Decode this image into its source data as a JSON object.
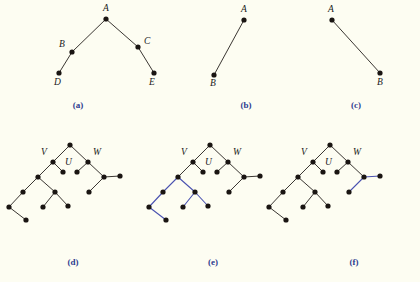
{
  "figure": {
    "background_color": "#fdfdf2",
    "edge_color": "#241f1c",
    "highlight_color": "#4a52b0",
    "node_color": "#1a1512",
    "caption_color": "#2d3b8f",
    "node_radius": 2.6,
    "edge_width": 0.9,
    "highlight_width": 1.1
  },
  "panels": [
    {
      "id": "a",
      "caption": "(a)",
      "caption_x": 63,
      "caption_y": 100,
      "nodes": [
        {
          "name": "A",
          "x": 106,
          "y": 19
        },
        {
          "name": "B",
          "x": 72,
          "y": 52
        },
        {
          "name": "C",
          "x": 138,
          "y": 47
        },
        {
          "name": "D",
          "x": 59,
          "y": 73
        },
        {
          "name": "E",
          "x": 154,
          "y": 73
        }
      ],
      "labels": [
        {
          "text": "A",
          "x": 103,
          "y": 4
        },
        {
          "text": "B",
          "x": 59,
          "y": 40
        },
        {
          "text": "C",
          "x": 144,
          "y": 37
        },
        {
          "text": "D",
          "x": 54,
          "y": 78
        },
        {
          "text": "E",
          "x": 149,
          "y": 78
        }
      ],
      "edges": [
        {
          "from": "A",
          "to": "B",
          "highlight": false
        },
        {
          "from": "B",
          "to": "D",
          "highlight": false
        },
        {
          "from": "A",
          "to": "C",
          "highlight": false
        },
        {
          "from": "C",
          "to": "E",
          "highlight": false
        }
      ]
    },
    {
      "id": "b",
      "caption": "(b)",
      "caption_x": 231,
      "caption_y": 100,
      "nodes": [
        {
          "name": "A",
          "x": 244,
          "y": 20
        },
        {
          "name": "B",
          "x": 214,
          "y": 75
        }
      ],
      "labels": [
        {
          "text": "A",
          "x": 241,
          "y": 5
        },
        {
          "text": "B",
          "x": 210,
          "y": 79
        }
      ],
      "edges": [
        {
          "from": "A",
          "to": "B",
          "highlight": false
        }
      ]
    },
    {
      "id": "c",
      "caption": "(c)",
      "caption_x": 341,
      "caption_y": 100,
      "nodes": [
        {
          "name": "A",
          "x": 332,
          "y": 20
        },
        {
          "name": "B",
          "x": 380,
          "y": 73
        }
      ],
      "labels": [
        {
          "text": "A",
          "x": 328,
          "y": 5
        },
        {
          "text": "B",
          "x": 377,
          "y": 78
        }
      ],
      "edges": [
        {
          "from": "A",
          "to": "B",
          "highlight": false
        }
      ]
    },
    {
      "id": "d",
      "caption": "(d)",
      "caption_x": 58,
      "caption_y": 257,
      "nodes": [
        {
          "name": "r",
          "x": 70,
          "y": 145
        },
        {
          "name": "V",
          "x": 53,
          "y": 162
        },
        {
          "name": "u1",
          "x": 63,
          "y": 172
        },
        {
          "name": "u2",
          "x": 77,
          "y": 172
        },
        {
          "name": "W",
          "x": 88,
          "y": 162
        },
        {
          "name": "n1",
          "x": 38,
          "y": 177
        },
        {
          "name": "n2",
          "x": 23,
          "y": 192
        },
        {
          "name": "n3",
          "x": 9,
          "y": 207
        },
        {
          "name": "n4",
          "x": 26,
          "y": 220
        },
        {
          "name": "n5",
          "x": 55,
          "y": 192
        },
        {
          "name": "n6",
          "x": 43,
          "y": 207
        },
        {
          "name": "n7",
          "x": 68,
          "y": 206
        },
        {
          "name": "w1",
          "x": 104,
          "y": 177
        },
        {
          "name": "w2",
          "x": 120,
          "y": 176
        },
        {
          "name": "w3",
          "x": 89,
          "y": 192
        }
      ],
      "labels": [
        {
          "text": "V",
          "x": 41,
          "y": 148
        },
        {
          "text": "U",
          "x": 65,
          "y": 158
        },
        {
          "text": "W",
          "x": 93,
          "y": 148
        }
      ],
      "edges": [
        {
          "from": "r",
          "to": "V",
          "highlight": false
        },
        {
          "from": "r",
          "to": "W",
          "highlight": false
        },
        {
          "from": "V",
          "to": "u1",
          "highlight": false
        },
        {
          "from": "W",
          "to": "u2",
          "highlight": false
        },
        {
          "from": "V",
          "to": "n1",
          "highlight": false
        },
        {
          "from": "n1",
          "to": "n2",
          "highlight": false
        },
        {
          "from": "n2",
          "to": "n3",
          "highlight": false
        },
        {
          "from": "n3",
          "to": "n4",
          "highlight": false
        },
        {
          "from": "n1",
          "to": "n5",
          "highlight": false
        },
        {
          "from": "n5",
          "to": "n6",
          "highlight": false
        },
        {
          "from": "n5",
          "to": "n7",
          "highlight": false
        },
        {
          "from": "W",
          "to": "w1",
          "highlight": false
        },
        {
          "from": "w1",
          "to": "w2",
          "highlight": false
        },
        {
          "from": "w1",
          "to": "w3",
          "highlight": false
        }
      ]
    },
    {
      "id": "e",
      "caption": "(e)",
      "caption_x": 198,
      "caption_y": 257,
      "nodes": [
        {
          "name": "r",
          "x": 210,
          "y": 145
        },
        {
          "name": "V",
          "x": 193,
          "y": 162
        },
        {
          "name": "u1",
          "x": 203,
          "y": 172
        },
        {
          "name": "u2",
          "x": 217,
          "y": 172
        },
        {
          "name": "W",
          "x": 228,
          "y": 162
        },
        {
          "name": "n1",
          "x": 178,
          "y": 177
        },
        {
          "name": "n2",
          "x": 163,
          "y": 192
        },
        {
          "name": "n3",
          "x": 149,
          "y": 207
        },
        {
          "name": "n4",
          "x": 166,
          "y": 220
        },
        {
          "name": "n5",
          "x": 195,
          "y": 192
        },
        {
          "name": "n6",
          "x": 183,
          "y": 207
        },
        {
          "name": "n7",
          "x": 208,
          "y": 206
        },
        {
          "name": "w1",
          "x": 244,
          "y": 177
        },
        {
          "name": "w2",
          "x": 260,
          "y": 176
        },
        {
          "name": "w3",
          "x": 229,
          "y": 192
        }
      ],
      "labels": [
        {
          "text": "V",
          "x": 181,
          "y": 148
        },
        {
          "text": "U",
          "x": 205,
          "y": 158
        },
        {
          "text": "W",
          "x": 233,
          "y": 148
        }
      ],
      "edges": [
        {
          "from": "r",
          "to": "V",
          "highlight": false
        },
        {
          "from": "r",
          "to": "W",
          "highlight": false
        },
        {
          "from": "V",
          "to": "u1",
          "highlight": false
        },
        {
          "from": "W",
          "to": "u2",
          "highlight": false
        },
        {
          "from": "V",
          "to": "n1",
          "highlight": false
        },
        {
          "from": "n1",
          "to": "n2",
          "highlight": true
        },
        {
          "from": "n2",
          "to": "n3",
          "highlight": true
        },
        {
          "from": "n3",
          "to": "n4",
          "highlight": true
        },
        {
          "from": "n1",
          "to": "n5",
          "highlight": true
        },
        {
          "from": "n5",
          "to": "n6",
          "highlight": true
        },
        {
          "from": "n5",
          "to": "n7",
          "highlight": true
        },
        {
          "from": "W",
          "to": "w1",
          "highlight": false
        },
        {
          "from": "w1",
          "to": "w2",
          "highlight": false
        },
        {
          "from": "w1",
          "to": "w3",
          "highlight": false
        }
      ]
    },
    {
      "id": "f",
      "caption": "(f)",
      "caption_x": 339,
      "caption_y": 257,
      "nodes": [
        {
          "name": "r",
          "x": 330,
          "y": 145
        },
        {
          "name": "V",
          "x": 313,
          "y": 162
        },
        {
          "name": "u1",
          "x": 323,
          "y": 172
        },
        {
          "name": "u2",
          "x": 337,
          "y": 172
        },
        {
          "name": "W",
          "x": 348,
          "y": 162
        },
        {
          "name": "n1",
          "x": 298,
          "y": 177
        },
        {
          "name": "n2",
          "x": 283,
          "y": 192
        },
        {
          "name": "n3",
          "x": 269,
          "y": 207
        },
        {
          "name": "n4",
          "x": 286,
          "y": 220
        },
        {
          "name": "n5",
          "x": 315,
          "y": 192
        },
        {
          "name": "n6",
          "x": 303,
          "y": 207
        },
        {
          "name": "n7",
          "x": 328,
          "y": 206
        },
        {
          "name": "w1",
          "x": 364,
          "y": 177
        },
        {
          "name": "w2",
          "x": 380,
          "y": 176
        },
        {
          "name": "w3",
          "x": 349,
          "y": 192
        }
      ],
      "labels": [
        {
          "text": "V",
          "x": 301,
          "y": 148
        },
        {
          "text": "U",
          "x": 325,
          "y": 158
        },
        {
          "text": "W",
          "x": 353,
          "y": 148
        }
      ],
      "edges": [
        {
          "from": "r",
          "to": "V",
          "highlight": false
        },
        {
          "from": "r",
          "to": "W",
          "highlight": false
        },
        {
          "from": "V",
          "to": "u1",
          "highlight": false
        },
        {
          "from": "W",
          "to": "u2",
          "highlight": false
        },
        {
          "from": "V",
          "to": "n1",
          "highlight": false
        },
        {
          "from": "n1",
          "to": "n2",
          "highlight": false
        },
        {
          "from": "n2",
          "to": "n3",
          "highlight": false
        },
        {
          "from": "n3",
          "to": "n4",
          "highlight": false
        },
        {
          "from": "n1",
          "to": "n5",
          "highlight": false
        },
        {
          "from": "n5",
          "to": "n6",
          "highlight": false
        },
        {
          "from": "n5",
          "to": "n7",
          "highlight": false
        },
        {
          "from": "W",
          "to": "w1",
          "highlight": false
        },
        {
          "from": "w1",
          "to": "w2",
          "highlight": true
        },
        {
          "from": "w1",
          "to": "w3",
          "highlight": true
        }
      ]
    }
  ]
}
